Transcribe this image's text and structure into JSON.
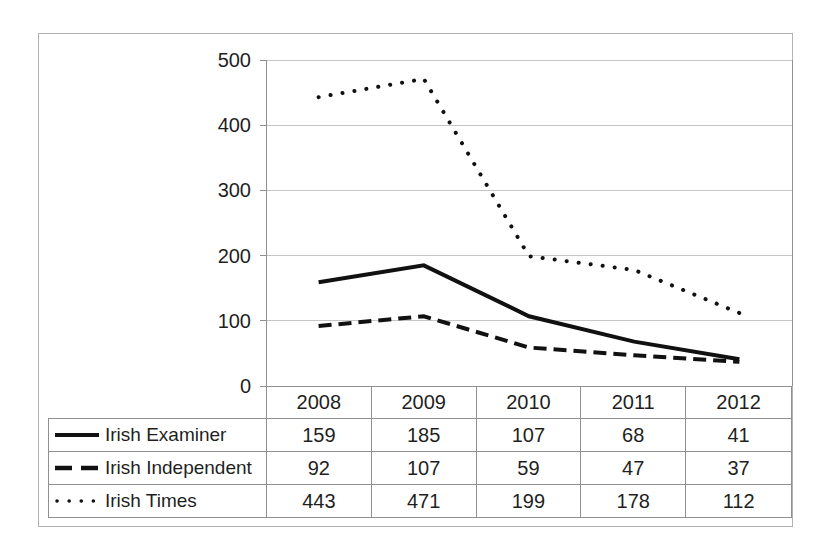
{
  "figure": {
    "title": "",
    "background": "#ffffff"
  },
  "colors": {
    "line": "#111111",
    "text": "#1f1f1f",
    "gridline": "#c6c6c6",
    "axis": "#909090",
    "table_border": "#909090",
    "frame_border": "#b3b3b3"
  },
  "chart_data": {
    "type": "line",
    "title": "",
    "xlabel": "",
    "ylabel": "",
    "categories": [
      "2008",
      "2009",
      "2010",
      "2011",
      "2012"
    ],
    "series": [
      {
        "name": "Irish Examiner",
        "line_style": "solid",
        "values": [
          159,
          185,
          107,
          68,
          41
        ]
      },
      {
        "name": "Irish Independent",
        "line_style": "dashed",
        "values": [
          92,
          107,
          59,
          47,
          37
        ]
      },
      {
        "name": "Irish Times",
        "line_style": "dotted",
        "values": [
          443,
          471,
          199,
          178,
          112
        ]
      }
    ],
    "ylim": [
      0,
      500
    ],
    "yticks": [
      0,
      100,
      200,
      300,
      400,
      500
    ],
    "grid": true,
    "legend_position": "data-table-left",
    "legend_entries": [
      "Irish Examiner",
      "Irish Independent",
      "Irish Times"
    ]
  }
}
